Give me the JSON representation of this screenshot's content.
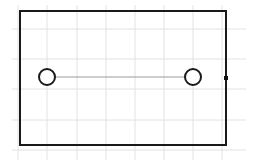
{
  "canvas": {
    "width": 258,
    "height": 166,
    "background": "#ffffff"
  },
  "grid": {
    "color": "#e2e2e2",
    "vertical_x": [
      18,
      47,
      77,
      106,
      135,
      164,
      193,
      222
    ],
    "horizontal_y": [
      29,
      59,
      89,
      120,
      150
    ],
    "extent": {
      "x1": 12,
      "y1": 5,
      "x2": 246,
      "y2": 160
    }
  },
  "shapes": {
    "rectangle": {
      "x": 20,
      "y": 11,
      "width": 206,
      "height": 134,
      "stroke": "#1a1a1a",
      "stroke_width": 2
    },
    "connector": {
      "x1": 55,
      "y1": 77,
      "x2": 185,
      "y2": 77,
      "stroke": "#9a9a9a",
      "stroke_width": 1
    },
    "circles": [
      {
        "id": "left-hole",
        "cx": 47,
        "cy": 77,
        "r": 8,
        "stroke": "#1a1a1a",
        "stroke_width": 2
      },
      {
        "id": "right-hole",
        "cx": 193,
        "cy": 77,
        "r": 8,
        "stroke": "#1a1a1a",
        "stroke_width": 2
      }
    ],
    "handle": {
      "x": 224,
      "y": 76,
      "size": 4,
      "fill": "#111111"
    }
  }
}
